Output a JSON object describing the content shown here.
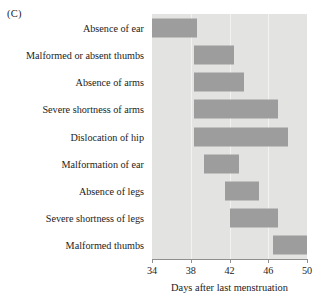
{
  "panel": {
    "letter": "(C)"
  },
  "chart_data": {
    "type": "bar",
    "orientation": "horizontal",
    "subtype": "range-bar",
    "title": "",
    "subtitle": "",
    "xlabel": "Days after last menstruation",
    "ylabel": "",
    "xlim": [
      34,
      50
    ],
    "ylim": null,
    "grid": true,
    "grid_axis": "x",
    "legend": false,
    "legend_position": "none",
    "xticks": [
      34,
      38,
      42,
      46,
      50
    ],
    "xtick_labels": [
      "34",
      "38",
      "42",
      "46",
      "50"
    ],
    "categories": [
      "Absence of ear",
      "Malformed or absent thumbs",
      "Absence of arms",
      "Severe shortness of arms",
      "Dislocation of hip",
      "Malformation of ear",
      "Absence of legs",
      "Severe shortness of legs",
      "Malformed thumbs"
    ],
    "bars": [
      {
        "category": "Absence of ear",
        "start": 34.0,
        "end": 38.6
      },
      {
        "category": "Malformed or absent thumbs",
        "start": 38.3,
        "end": 42.5
      },
      {
        "category": "Absence of arms",
        "start": 38.3,
        "end": 43.5
      },
      {
        "category": "Severe shortness of arms",
        "start": 38.3,
        "end": 47.0
      },
      {
        "category": "Dislocation of hip",
        "start": 38.3,
        "end": 48.0
      },
      {
        "category": "Malformation of ear",
        "start": 39.4,
        "end": 43.0
      },
      {
        "category": "Absence of legs",
        "start": 41.5,
        "end": 45.0
      },
      {
        "category": "Severe shortness of legs",
        "start": 42.0,
        "end": 47.0
      },
      {
        "category": "Malformed thumbs",
        "start": 46.5,
        "end": 50.0
      }
    ],
    "colors": {
      "bar": "#9d9d9d",
      "plot_background": "#e3e3e1",
      "gridline": "#f2f2f0",
      "axis": "#8f8f8f",
      "text": "#1c1c1c"
    }
  }
}
